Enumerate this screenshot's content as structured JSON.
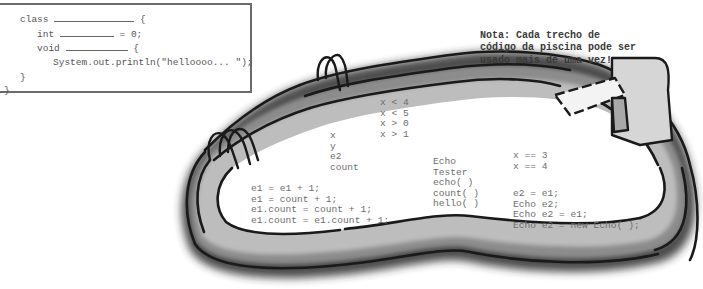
{
  "code_template": {
    "line1_kw": "class",
    "line1_end": "{",
    "line2_kw": "int",
    "line2_end": "= 0;",
    "line3_kw": "void",
    "line3_end": "{",
    "line4": "System.out.println(\"helloooo... \");",
    "line5": "}",
    "line6": "}"
  },
  "note": {
    "line1": "Nota: Cada trecho de",
    "line2": "código da piscina pode ser",
    "line3": "usado mais de uma vez!"
  },
  "pool_snippets": {
    "conditions": [
      "x < 4",
      "x < 5",
      "x > 0",
      "x > 1"
    ],
    "variables": [
      "x",
      "y",
      "e2",
      "count"
    ],
    "assignments": [
      "e1 = e1 + 1;",
      "e1 = count + 1;",
      "e1.count = count + 1;",
      "e1.count = e1.count + 1;"
    ],
    "names": [
      "Echo",
      "Tester",
      "echo( )",
      "count( )",
      "hello( )"
    ],
    "equality": [
      "x == 3",
      "x == 4"
    ],
    "declarations": [
      "e2 = e1;",
      "Echo e2;",
      "Echo e2 = e1;",
      "Echo e2 = new Echo( );"
    ]
  }
}
